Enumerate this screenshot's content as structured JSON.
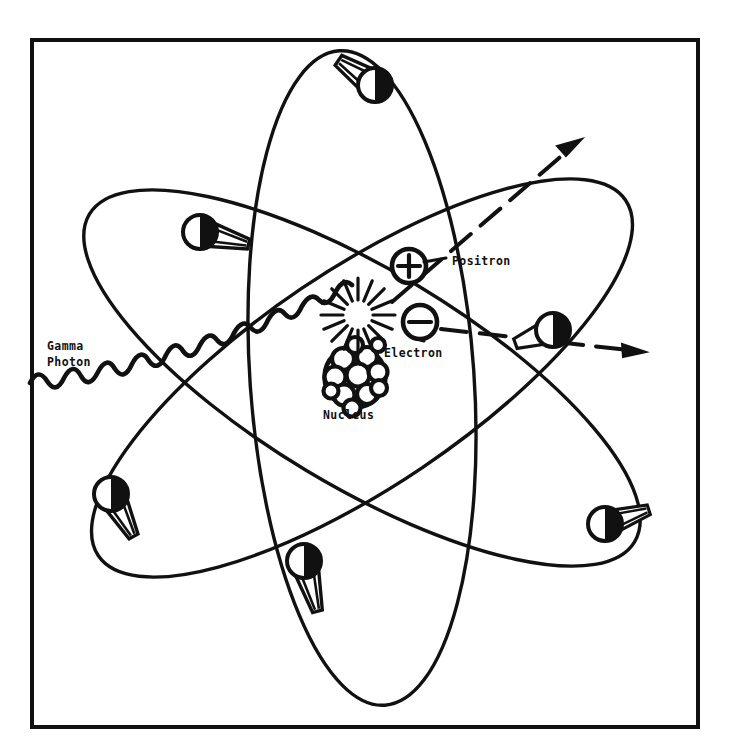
{
  "figure": {
    "background_color": "#ffffff",
    "ink_color": "#111111",
    "border": {
      "x": 32,
      "y": 40,
      "width": 666,
      "height": 687,
      "stroke_width": 4
    }
  },
  "labels": {
    "gamma_line1": "Gamma",
    "gamma_line2": "Photon",
    "positron": "Positron",
    "electron": "Electron",
    "nucleus": "Nucleus"
  },
  "particles": {
    "positron_symbol": "+",
    "electron_symbol": "−",
    "positron_position": {
      "x": 409,
      "y": 266
    },
    "electron_position": {
      "x": 420,
      "y": 322
    },
    "interaction_point": {
      "x": 367,
      "y": 317
    }
  },
  "nucleus": {
    "center": {
      "x": 355,
      "y": 377
    },
    "radius": 31,
    "nucleon_count": 12
  },
  "orbits": [
    {
      "name": "orbit-vertical",
      "cx": 362,
      "cy": 378,
      "rx": 112,
      "ry": 328,
      "rotation": -4
    },
    {
      "name": "orbit-tilted-left",
      "cx": 362,
      "cy": 378,
      "rx": 318,
      "ry": 108,
      "rotation": -34
    },
    {
      "name": "orbit-tilted-right",
      "cx": 362,
      "cy": 378,
      "rx": 318,
      "ry": 108,
      "rotation": 31
    }
  ],
  "orbiting_electrons": [
    {
      "name": "electron-top",
      "x": 375,
      "y": 85,
      "r": 17,
      "trail_angle": 214
    },
    {
      "name": "electron-upper-left",
      "x": 200,
      "y": 232,
      "r": 17,
      "trail_angle": 14
    },
    {
      "name": "electron-lower-left",
      "x": 111,
      "y": 494,
      "r": 17,
      "trail_angle": 62
    },
    {
      "name": "electron-bottom",
      "x": 304,
      "y": 561,
      "r": 17,
      "trail_angle": 300
    },
    {
      "name": "electron-right",
      "x": 553,
      "y": 330,
      "r": 17,
      "trail_angle": 160
    },
    {
      "name": "electron-lower-right",
      "x": 605,
      "y": 524,
      "r": 17,
      "trail_angle": 193
    }
  ],
  "gamma_photon": {
    "description": "sine wave entering from left edge toward interaction point",
    "start": {
      "x": 30,
      "y": 381
    },
    "end": {
      "x": 360,
      "y": 318
    },
    "wavelength": 34,
    "amplitude": 11
  },
  "trajectories": [
    {
      "name": "positron-track",
      "style": "dashed-arrow",
      "from": {
        "x": 380,
        "y": 305
      },
      "to": {
        "x": 580,
        "y": 140
      }
    },
    {
      "name": "electron-track",
      "style": "dashed-arrow",
      "from": {
        "x": 430,
        "y": 330
      },
      "to": {
        "x": 645,
        "y": 353
      }
    }
  ],
  "burst": {
    "name": "annihilation-burst",
    "center": {
      "x": 358,
      "y": 315
    },
    "ray_count": 16,
    "inner_radius": 15,
    "outer_radius": 38
  }
}
